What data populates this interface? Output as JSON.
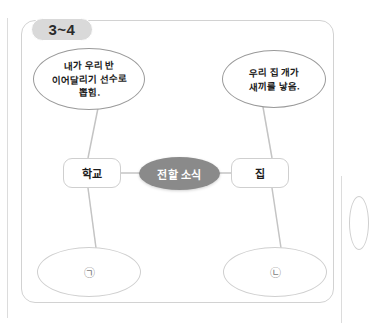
{
  "page": {
    "tab_label": "3~4",
    "accent_hub_color": "#8a8a8a",
    "border_color": "#d2d2d2",
    "badge_color": "#d9d9d9"
  },
  "diagram": {
    "type": "mind-map",
    "hub": {
      "label": "전할 소식"
    },
    "branches": [
      {
        "category": "학교",
        "bubble": {
          "lines": [
            "내가 우리 반",
            "이어달리기 선수로",
            "뽑힘."
          ]
        },
        "answer_marker": "㉠"
      },
      {
        "category": "집",
        "bubble": {
          "lines": [
            "우리 집 개가",
            "새끼를 낳음."
          ]
        },
        "answer_marker": "㉡"
      }
    ]
  }
}
